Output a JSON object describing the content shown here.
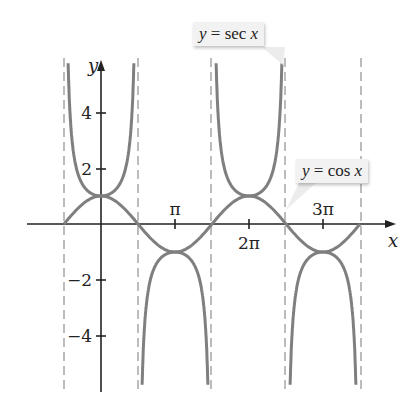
{
  "chart_data": {
    "type": "line",
    "title": "",
    "xlabel": "x",
    "ylabel": "y",
    "x_ticks": [
      "π",
      "2π",
      "3π"
    ],
    "y_ticks": [
      "4",
      "2",
      "-2",
      "-4"
    ],
    "xlim": [
      -1.571,
      4.712
    ],
    "ylim": [
      -5.9,
      5.9
    ],
    "grid": false,
    "asymptotes_x": [
      "-π/2",
      "π/2",
      "3π/2",
      "5π/2",
      "7π/2"
    ],
    "series": [
      {
        "name": "y = sec x",
        "color": "#7a7a7a",
        "x": [
          "0",
          "π",
          "2π",
          "3π"
        ],
        "values": [
          1,
          -1,
          1,
          -1
        ]
      },
      {
        "name": "y = cos x",
        "color": "#7a7a7a",
        "x": [
          "-π/2",
          "0",
          "π/2",
          "π",
          "3π/2",
          "2π",
          "5π/2",
          "3π",
          "7π/2"
        ],
        "values": [
          0,
          1,
          0,
          -1,
          0,
          1,
          0,
          -1,
          0
        ]
      }
    ],
    "annotations": [
      "y = sec x",
      "y = cos x"
    ]
  },
  "labels": {
    "x_axis": "x",
    "y_axis": "y",
    "tick_pi": "π",
    "tick_2pi": "2π",
    "tick_3pi": "3π",
    "tick_4": "4",
    "tick_2": "2",
    "tick_m2": "−2",
    "tick_m4": "−4",
    "sec_label_y": "y",
    "sec_label_rest": " = sec ",
    "sec_label_x": "x",
    "cos_label_y": "y",
    "cos_label_rest": " = cos ",
    "cos_label_x": "x"
  }
}
